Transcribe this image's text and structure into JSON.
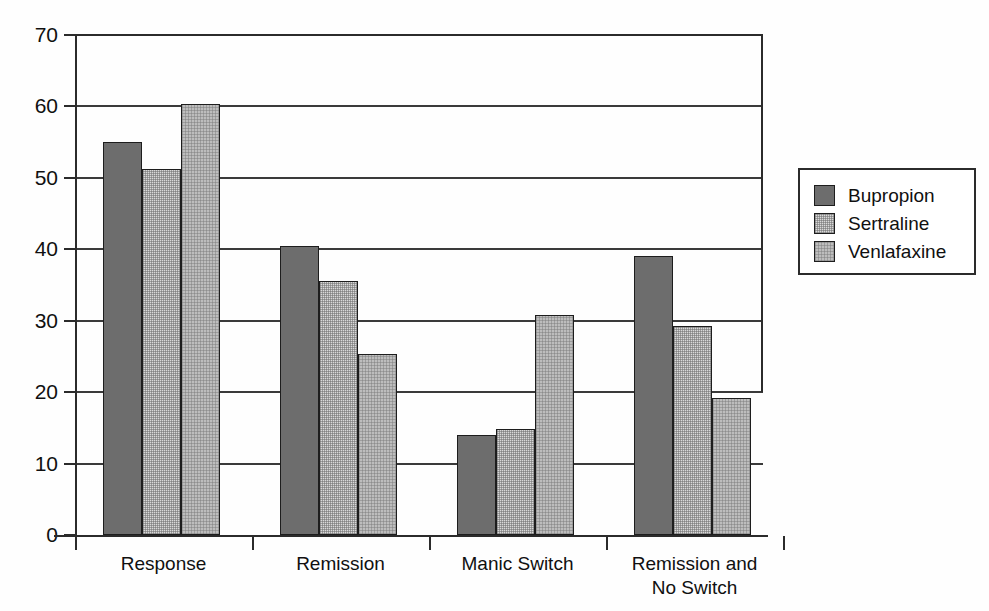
{
  "chart_data": {
    "type": "bar",
    "title": "",
    "subtitle": "",
    "xlabel": "",
    "ylabel": "",
    "categories": [
      "Response",
      "Remission",
      "Manic Switch",
      "Remission and\nNo Switch"
    ],
    "series": [
      {
        "name": "Bupropion",
        "color": "#6d6d6d",
        "values": [
          55.0,
          40.4,
          14.0,
          39.0
        ]
      },
      {
        "name": "Sertraline",
        "color": "#d9d9d9",
        "values": [
          51.3,
          35.6,
          14.8,
          29.2
        ]
      },
      {
        "name": "Venlafaxine",
        "color": "#bdbdbd",
        "values": [
          60.3,
          25.4,
          30.8,
          19.2
        ]
      }
    ],
    "ylim": [
      0,
      70
    ],
    "yticks": [
      0,
      10,
      20,
      30,
      40,
      50,
      60,
      70
    ],
    "ytick_labels": [
      "0",
      "10",
      "20",
      "30",
      "40",
      "50",
      "60",
      "70"
    ],
    "grid": true,
    "grid_axis": "y",
    "legend": {
      "position": "right",
      "entries": [
        "Bupropion",
        "Sertraline",
        "Venlafaxine"
      ]
    }
  },
  "axis": {
    "y_labels": [
      "70",
      "60",
      "50",
      "40",
      "30",
      "20",
      "10",
      "0"
    ],
    "x_labels": [
      {
        "line1": "Response",
        "line2": ""
      },
      {
        "line1": "Remission",
        "line2": ""
      },
      {
        "line1": "Manic Switch",
        "line2": ""
      },
      {
        "line1": "Remission and",
        "line2": "No Switch"
      }
    ]
  },
  "legend": {
    "items": [
      {
        "label": "Bupropion",
        "color": "#6d6d6d"
      },
      {
        "label": "Sertraline",
        "color": "#d9d9d9"
      },
      {
        "label": "Venlafaxine",
        "color": "#bdbdbd"
      }
    ]
  }
}
